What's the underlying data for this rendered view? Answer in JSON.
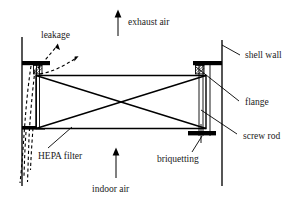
{
  "figure": {
    "type": "engineering-cross-section-diagram",
    "background_color": "#ffffff",
    "line_color": "#000000"
  },
  "labels": {
    "leakage": "leakage",
    "exhaust_air": "exhaust air",
    "shell_wall": "shell wall",
    "flange": "flange",
    "screw_rod": "screw rod",
    "hepa_filter": "HEPA filter",
    "briquetting": "briquetting",
    "indoor_air": "indoor air"
  },
  "flow_arrows": [
    {
      "name": "exhaust-air-arrow",
      "direction": "up",
      "label": "exhaust air"
    },
    {
      "name": "indoor-air-arrow",
      "direction": "up",
      "label": "indoor air"
    }
  ],
  "leakage_arrows": [
    {
      "name": "leakage-arrow-upper",
      "style": "dashed",
      "direction": "up-right"
    },
    {
      "name": "leakage-arrow-lower",
      "style": "dashed",
      "direction": "up-right"
    },
    {
      "name": "leakage-path-downward",
      "style": "dashed",
      "direction": "down"
    }
  ],
  "components": [
    {
      "name": "shell-wall-left",
      "kind": "vertical-wall"
    },
    {
      "name": "shell-wall-right",
      "kind": "vertical-wall"
    },
    {
      "name": "flange-upper-left",
      "kind": "flange-bar"
    },
    {
      "name": "flange-upper-right",
      "kind": "flange-bar"
    },
    {
      "name": "flange-lower-left",
      "kind": "flange-bar"
    },
    {
      "name": "flange-lower-right",
      "kind": "flange-bar"
    },
    {
      "name": "hepa-filter-body",
      "kind": "rectangle-with-diagonals"
    },
    {
      "name": "screw-rod-left",
      "kind": "rod"
    },
    {
      "name": "screw-rod-right",
      "kind": "rod"
    },
    {
      "name": "briquetting-clamp",
      "kind": "clamp-cross"
    }
  ]
}
